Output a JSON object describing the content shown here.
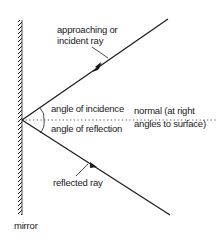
{
  "diagram": {
    "labels": {
      "incident_ray_line1": "approaching or",
      "incident_ray_line2": "incident ray",
      "angle_of_incidence": "angle of incidence",
      "angle_of_reflection": "angle of reflection",
      "normal_line1": "normal (at right",
      "normal_line2": "angles to surface)",
      "reflected_ray": "reflected ray",
      "mirror": "mirror"
    },
    "nodes": [
      {
        "id": "mirror",
        "label": "mirror"
      },
      {
        "id": "incident-ray",
        "label": "approaching or incident ray"
      },
      {
        "id": "reflected-ray",
        "label": "reflected ray"
      },
      {
        "id": "normal",
        "label": "normal (at right angles to surface)"
      },
      {
        "id": "angle-incidence",
        "label": "angle of incidence"
      },
      {
        "id": "angle-reflection",
        "label": "angle of reflection"
      }
    ],
    "edges": [
      {
        "from": "incident-ray",
        "to": "mirror",
        "relation": "strikes at point of incidence"
      },
      {
        "from": "mirror",
        "to": "reflected-ray",
        "relation": "reflects"
      }
    ],
    "colors": {
      "ink": "#1a1a1a",
      "background": "#ffffff"
    }
  }
}
